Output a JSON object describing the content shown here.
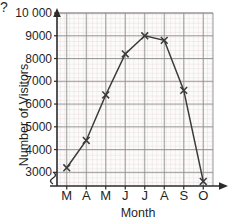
{
  "page": {
    "question_fragment": "?"
  },
  "chart_data": {
    "type": "line",
    "title": "",
    "xlabel": "Month",
    "ylabel": "Number of Visitors",
    "categories": [
      "M",
      "A",
      "M",
      "J",
      "J",
      "A",
      "S",
      "O"
    ],
    "category_names": [
      "March",
      "April",
      "May",
      "June",
      "July",
      "August",
      "September",
      "October"
    ],
    "values": [
      3200,
      4400,
      6400,
      8200,
      9000,
      8800,
      6600,
      2600
    ],
    "ylim": [
      2400,
      10000
    ],
    "ytick_labels": [
      "10 000",
      "9000",
      "8000",
      "7000",
      "6000",
      "5000",
      "4000",
      "3000"
    ],
    "ytick_values": [
      10000,
      9000,
      8000,
      7000,
      6000,
      5000,
      4000,
      3000
    ],
    "grid": true,
    "axis_break": true,
    "legend": "none",
    "marker": "x",
    "line_color": "#3a3a3a",
    "grid_color": "#d8c9c9",
    "major_grid_color": "#8f8f8f",
    "axis_color": "#2b2b2b",
    "plot_background": "#fbfafa"
  }
}
